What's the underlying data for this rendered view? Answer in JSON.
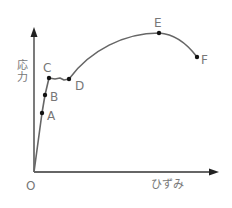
{
  "diagram": {
    "title": "",
    "type": "stress-strain curve",
    "colors": {
      "axis": "#333333",
      "curve": "#666666",
      "point": "#111111",
      "label": "#777777"
    },
    "axes": {
      "origin_label": "O",
      "x_label": "ひずみ",
      "y_label_line1": "応",
      "y_label_line2": "力"
    },
    "points": [
      {
        "id": "A",
        "label": "A",
        "x": 42,
        "y": 113
      },
      {
        "id": "B",
        "label": "B",
        "x": 45,
        "y": 95
      },
      {
        "id": "C",
        "label": "C",
        "x": 49,
        "y": 78
      },
      {
        "id": "D",
        "label": "D",
        "x": 69,
        "y": 79
      },
      {
        "id": "E",
        "label": "E",
        "x": 159,
        "y": 33
      },
      {
        "id": "F",
        "label": "F",
        "x": 197,
        "y": 57
      }
    ]
  }
}
